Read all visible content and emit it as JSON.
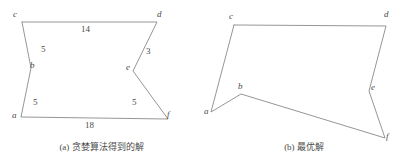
{
  "figure": {
    "background_color": "#ffffff",
    "stroke_color": "#8a8a8a",
    "text_color": "#4a4a4a"
  },
  "panel_a": {
    "caption": "(a) 贪婪算法得到的解",
    "vertices": [
      {
        "name": "c",
        "label": "c",
        "x": 22,
        "y": 22,
        "lx": 14,
        "ly": 12
      },
      {
        "name": "d",
        "label": "d",
        "x": 157,
        "y": 22,
        "lx": 158,
        "ly": 12
      },
      {
        "name": "b",
        "label": "b",
        "x": 31,
        "y": 68,
        "lx": 31,
        "ly": 62
      },
      {
        "name": "e",
        "label": "e",
        "x": 133,
        "y": 71,
        "lx": 127,
        "ly": 64
      },
      {
        "name": "a",
        "label": "a",
        "x": 21,
        "y": 117,
        "lx": 13,
        "ly": 112
      },
      {
        "name": "f",
        "label": "f",
        "x": 168,
        "y": 119,
        "lx": 168,
        "ly": 112
      }
    ],
    "edges": [
      {
        "name": "edge-c-d",
        "from": "c",
        "to": "d",
        "weight": "14",
        "wx": 83,
        "wy": 26
      },
      {
        "name": "edge-c-b",
        "from": "c",
        "to": "b",
        "weight": "5",
        "wx": 42,
        "wy": 46
      },
      {
        "name": "edge-b-a",
        "from": "b",
        "to": "a",
        "weight": "5",
        "wx": 34,
        "wy": 99
      },
      {
        "name": "edge-a-f",
        "from": "a",
        "to": "f",
        "weight": "18",
        "wx": 88,
        "wy": 122
      },
      {
        "name": "edge-f-e",
        "from": "f",
        "to": "e",
        "weight": "5",
        "wx": 133,
        "wy": 99
      },
      {
        "name": "edge-e-d",
        "from": "e",
        "to": "d",
        "weight": "3",
        "wx": 147,
        "wy": 48
      }
    ],
    "polyline": "22,22 157,22 133,71 168,119 21,117 31,68 22,22"
  },
  "panel_b": {
    "caption": "(b) 最优解",
    "vertices": [
      {
        "name": "c",
        "label": "c",
        "x": 31,
        "y": 25,
        "lx": 26,
        "ly": 13
      },
      {
        "name": "d",
        "label": "d",
        "x": 183,
        "y": 26,
        "lx": 182,
        "ly": 12
      },
      {
        "name": "b",
        "label": "b",
        "x": 38,
        "y": 94,
        "lx": 36,
        "ly": 83
      },
      {
        "name": "e",
        "label": "e",
        "x": 166,
        "y": 91,
        "lx": 169,
        "ly": 84
      },
      {
        "name": "a",
        "label": "a",
        "x": 8,
        "y": 112,
        "lx": 2,
        "ly": 108
      },
      {
        "name": "f",
        "label": "f",
        "x": 182,
        "y": 138,
        "lx": 184,
        "ly": 133
      }
    ],
    "edges": [
      {
        "name": "edge-c-d",
        "from": "c",
        "to": "d"
      },
      {
        "name": "edge-c-a",
        "from": "c",
        "to": "a"
      },
      {
        "name": "edge-a-b",
        "from": "a",
        "to": "b"
      },
      {
        "name": "edge-b-f",
        "from": "b",
        "to": "f"
      },
      {
        "name": "edge-f-e",
        "from": "f",
        "to": "e"
      },
      {
        "name": "edge-e-d",
        "from": "e",
        "to": "d"
      }
    ],
    "polyline": "31,25 183,26 166,91 182,138 38,94 8,112 31,25"
  }
}
